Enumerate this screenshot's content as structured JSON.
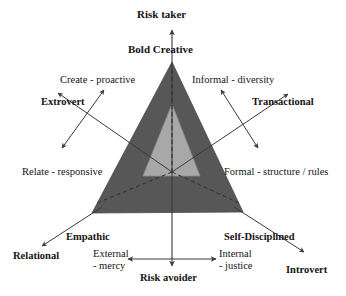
{
  "diagram": {
    "type": "triangle-axes-model",
    "title_visible": false,
    "colors": {
      "outer_triangle_fill": "#575757",
      "inner_triangle_fill": "#a8a8a8",
      "line": "#3a3a3a",
      "text": "#141414",
      "background": "#ffffff"
    },
    "geometry": {
      "center": {
        "x": 172,
        "y": 172
      },
      "outer_triangle": [
        {
          "x": 172,
          "y": 62
        },
        {
          "x": 92,
          "y": 213
        },
        {
          "x": 243,
          "y": 212
        }
      ],
      "inner_triangle": [
        {
          "x": 172,
          "y": 104
        },
        {
          "x": 143,
          "y": 176
        },
        {
          "x": 200,
          "y": 176
        }
      ]
    },
    "axis_labels": {
      "top_outer": "Risk taker",
      "top_inner": "Bold Creative",
      "bottom_inner_left": "External - mercy",
      "bottom_inner_right": "Internal - justice",
      "bottom_outer": "Risk avoider"
    },
    "left_branch": {
      "outer": "Extrovert",
      "upper_trait": "Create - proactive",
      "lower_trait": "Relate - responsive",
      "corner": "Relational",
      "corner_inner": "Empathic"
    },
    "right_branch": {
      "outer": "Transactional",
      "upper_trait": "Informal - diversity",
      "lower_trait": "Formal - structure / rules",
      "corner": "Introvert",
      "corner_inner": "Self-Disciplined"
    },
    "all_labels": [
      "Risk taker",
      "Bold Creative",
      "Create - proactive",
      "Informal - diversity",
      "Extrovert",
      "Transactional",
      "Relate - responsive",
      "Formal - structure / rules",
      "Empathic",
      "Self-Disciplined",
      "Relational",
      "Introvert",
      "External - mercy",
      "Internal - justice",
      "Risk avoider"
    ]
  }
}
